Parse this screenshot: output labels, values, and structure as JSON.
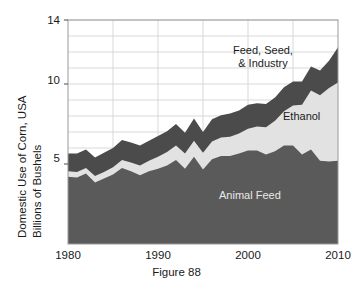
{
  "page": {
    "top_bleed_text": "­­­­ ­­­­­­­­ ­­­­­",
    "caption": "Figure 88"
  },
  "chart_data": {
    "type": "area",
    "stacked": true,
    "title": "",
    "subtitle": "",
    "xlabel": "",
    "ylabel": "Domestic Use of Corn, USA Billions of Bushels",
    "ylabel_line1": "Domestic Use of Corn, USA",
    "ylabel_line2": "Billions of Bushels",
    "xlim": [
      1980,
      2010
    ],
    "ylim": [
      0,
      14
    ],
    "ytick_labels": [
      "5",
      "10",
      "14"
    ],
    "yticks": [
      5,
      10,
      14
    ],
    "xtick_labels": [
      "1980",
      "1990",
      "2000",
      "2010"
    ],
    "xticks": [
      1980,
      1990,
      2000,
      2010
    ],
    "grid": true,
    "grid_y_step": 1,
    "grid_x_step": 5,
    "legend_position": "inline-annotations",
    "colors": {
      "animal_feed": "#5a5a5a",
      "ethanol": "#e2e2e2",
      "feed_seed_industry": "#4b4b4b",
      "grid": "#cfcfcf",
      "axis": "#8a8a8a",
      "label_dark": "#1a1a1a",
      "label_light": "#e8e8e8"
    },
    "annotations": [
      {
        "name": "feed-seed-industry",
        "text_line1": "Feed, Seed,",
        "text_line2": "& Industry"
      },
      {
        "name": "ethanol",
        "text_line1": "Ethanol"
      },
      {
        "name": "animal-feed",
        "text_line1": "Animal Feed"
      }
    ],
    "x": [
      1980,
      1981,
      1982,
      1983,
      1984,
      1985,
      1986,
      1987,
      1988,
      1989,
      1990,
      1991,
      1992,
      1993,
      1994,
      1995,
      1996,
      1997,
      1998,
      1999,
      2000,
      2001,
      2002,
      2003,
      2004,
      2005,
      2006,
      2007,
      2008,
      2009,
      2010
    ],
    "series": [
      {
        "name": "Animal Feed",
        "values": [
          4.2,
          4.15,
          4.4,
          3.85,
          4.1,
          4.35,
          4.75,
          4.55,
          4.3,
          4.55,
          4.7,
          4.9,
          5.25,
          4.7,
          5.45,
          4.65,
          5.3,
          5.5,
          5.5,
          5.65,
          5.85,
          5.85,
          5.6,
          5.8,
          6.15,
          6.15,
          5.6,
          5.9,
          5.2,
          5.15,
          5.2
        ]
      },
      {
        "name": "Ethanol",
        "values": [
          0.35,
          0.35,
          0.35,
          0.4,
          0.4,
          0.45,
          0.5,
          0.55,
          0.6,
          0.65,
          0.75,
          0.85,
          0.9,
          0.95,
          1.0,
          1.05,
          1.1,
          1.15,
          1.2,
          1.25,
          1.35,
          1.5,
          1.7,
          1.9,
          2.15,
          2.5,
          3.1,
          3.7,
          4.1,
          4.6,
          4.9
        ]
      },
      {
        "name": "Feed, Seed, & Industry",
        "values": [
          1.1,
          1.15,
          1.15,
          1.15,
          1.2,
          1.2,
          1.25,
          1.25,
          1.25,
          1.25,
          1.3,
          1.3,
          1.35,
          1.3,
          1.4,
          1.3,
          1.4,
          1.4,
          1.45,
          1.45,
          1.5,
          1.45,
          1.45,
          1.45,
          1.5,
          1.5,
          1.45,
          1.5,
          1.55,
          1.7,
          2.2
        ]
      }
    ],
    "totals": [
      5.65,
      5.65,
      5.9,
      5.4,
      5.7,
      6.0,
      6.5,
      6.35,
      6.15,
      6.45,
      6.75,
      7.05,
      7.5,
      6.95,
      7.85,
      7.0,
      7.8,
      8.05,
      8.15,
      8.35,
      8.7,
      8.8,
      8.75,
      9.15,
      9.8,
      10.15,
      10.15,
      11.1,
      10.85,
      11.45,
      12.3
    ]
  }
}
